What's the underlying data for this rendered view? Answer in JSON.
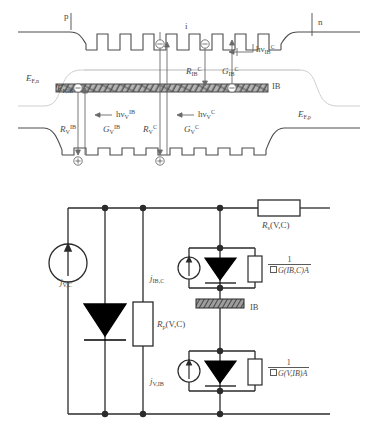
{
  "figure": {
    "panels": [
      "band-diagram",
      "equivalent-circuit"
    ]
  },
  "band_diagram": {
    "region_labels": {
      "p": "p",
      "i": "i",
      "n": "n"
    },
    "quasi_fermi_levels": {
      "n": {
        "base": "E",
        "sub": "F,n"
      },
      "ib": {
        "base": "E",
        "sub": "F,IB"
      },
      "p": {
        "base": "E",
        "sub": "F,p"
      }
    },
    "ib_band_label": "IB",
    "carriers": {
      "electron": "⊖",
      "hole": "⊕"
    },
    "transitions": [
      {
        "name": "R_IB_C",
        "base": "R",
        "sub": "IB",
        "sup": "C"
      },
      {
        "name": "G_IB_C",
        "base": "G",
        "sub": "IB",
        "sup": "C"
      },
      {
        "name": "R_V_IB",
        "base": "R",
        "sub": "V",
        "sup": "IB"
      },
      {
        "name": "G_V_IB",
        "base": "G",
        "sub": "V",
        "sup": "IB"
      },
      {
        "name": "R_V_C",
        "base": "R",
        "sub": "V",
        "sup": "C"
      },
      {
        "name": "G_V_C",
        "base": "G",
        "sub": "V",
        "sup": "C"
      }
    ],
    "photons": [
      {
        "name": "hv_IB_C",
        "base": "hν",
        "sub": "IB",
        "sup": "C"
      },
      {
        "name": "hv_V_IB",
        "base": "hν",
        "sub": "V",
        "sup": "IB"
      },
      {
        "name": "hv_V_C",
        "base": "hν",
        "sub": "V",
        "sup": "C"
      }
    ]
  },
  "circuit": {
    "series_resistor": {
      "base": "R",
      "sub": "s",
      "arg": "(V,C)"
    },
    "shunt_resistor": {
      "base": "R",
      "sub": "p",
      "arg": "(V,C)"
    },
    "current_sources": [
      {
        "name": "j_VC",
        "base": "j",
        "sub": "V,C"
      },
      {
        "name": "j_IB_C",
        "base": "j",
        "sub": "IB,C"
      },
      {
        "name": "j_V_IB",
        "base": "j",
        "sub": "V,IB"
      }
    ],
    "ib_block_label": "IB",
    "conductances": [
      {
        "name": "G_IB_C",
        "numerator": "1",
        "denominator": "G(IB,C)A",
        "prefix_box": true
      },
      {
        "name": "G_V_IB",
        "numerator": "1",
        "denominator": "G(V,IB)A",
        "prefix_box": true
      }
    ]
  },
  "colors": {
    "line": "#5a5a5a",
    "dark_line": "#3a3a3a",
    "circuit_line": "#2b2b2b",
    "ib_band_fill": "#9a9a9a",
    "diode_fill": "#000000",
    "text": "#4a4a4a"
  }
}
